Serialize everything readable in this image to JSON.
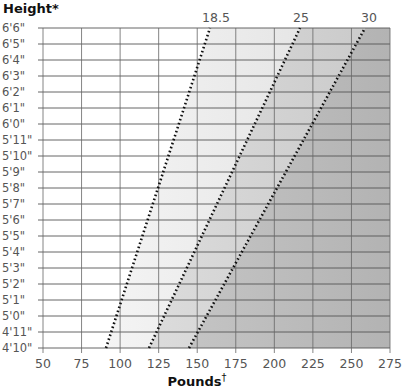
{
  "chart_data": {
    "type": "line",
    "title": "",
    "ylabel": "Height*",
    "xlabel": "Pounds†",
    "x_ticks": [
      50,
      75,
      100,
      125,
      150,
      175,
      200,
      225,
      250,
      275
    ],
    "xlim": [
      50,
      275
    ],
    "y_ticks": [
      "6'6\"",
      "6'5\"",
      "6'4\"",
      "6'3\"",
      "6'2\"",
      "6'1\"",
      "6'0\"",
      "5'11\"",
      "5'10\"",
      "5'9\"",
      "5'8\"",
      "5'7\"",
      "5'6\"",
      "5'5\"",
      "5'4\"",
      "5'3\"",
      "5'2\"",
      "5'1\"",
      "5'0\"",
      "4'11\"",
      "4'10\""
    ],
    "ylim_inches": [
      58,
      78
    ],
    "grid": true,
    "series": [
      {
        "name": "18.5",
        "style": "dotted",
        "points": [
          {
            "pounds": 89,
            "height": "4'10\""
          },
          {
            "pounds": 160,
            "height": "6'6\""
          }
        ]
      },
      {
        "name": "25",
        "style": "dotted",
        "points": [
          {
            "pounds": 119,
            "height": "4'10\""
          },
          {
            "pounds": 216,
            "height": "6'6\""
          }
        ]
      },
      {
        "name": "30",
        "style": "dotted",
        "points": [
          {
            "pounds": 143,
            "height": "4'10\""
          },
          {
            "pounds": 259,
            "height": "6'6\""
          }
        ]
      }
    ],
    "regions": [
      {
        "name": "underweight",
        "fill": "#ffffff"
      },
      {
        "name": "healthy",
        "fill": "#ececec"
      },
      {
        "name": "overweight",
        "fill": "#d2d2d2"
      },
      {
        "name": "obese",
        "fill": "#b8b8b8"
      }
    ]
  },
  "labels": {
    "y_title": "Height*",
    "x_title": "Pounds",
    "x_title_mark": "†",
    "bmi_18": "18.5",
    "bmi_25": "25",
    "bmi_30": "30"
  }
}
